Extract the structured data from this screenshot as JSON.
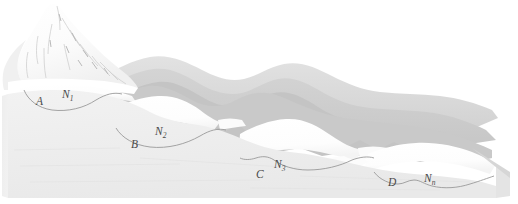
{
  "figure": {
    "background_color": "#ffffff",
    "width": 518,
    "height": 204
  },
  "palette": {
    "paper": "#ffffff",
    "snow_peak": "#fdfdfd",
    "snow_patch": "#fbfbfb",
    "ridge_far": "#dcdcdc",
    "ridge_mid": "#cfcfcf",
    "ridge_near": "#c4c4c4",
    "foreground_slope": "#ededed",
    "foreground_slope_light": "#f3f3f3",
    "outline": "#9a9a9a",
    "label_color": "#4a4a4a",
    "shading_line": "#c9c9c9"
  },
  "labels": {
    "hollows": [
      {
        "id": "hollow-a",
        "letter": "A",
        "letter_x": 36,
        "letter_y": 105,
        "hollow_name": "N",
        "hollow_subscript": "1",
        "hollow_x": 62,
        "hollow_y": 98
      },
      {
        "id": "hollow-b",
        "letter": "B",
        "letter_x": 131,
        "letter_y": 148,
        "hollow_name": "N",
        "hollow_subscript": "2",
        "hollow_x": 155,
        "hollow_y": 135
      },
      {
        "id": "hollow-c",
        "letter": "C",
        "letter_x": 256,
        "letter_y": 178,
        "hollow_name": "N",
        "hollow_subscript": "3",
        "hollow_x": 274,
        "hollow_y": 168
      },
      {
        "id": "hollow-d",
        "letter": "D",
        "letter_x": 388,
        "letter_y": 186,
        "hollow_name": "N",
        "hollow_subscript": "n",
        "hollow_x": 424,
        "hollow_y": 182
      }
    ]
  },
  "scene": {
    "peak_name": "snow-capped-summit",
    "ridge_count": 4,
    "hollow_count": 4,
    "slope_direction": "upper-left to lower-right"
  }
}
